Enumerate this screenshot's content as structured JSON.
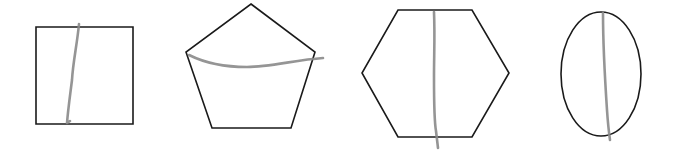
{
  "figure": {
    "colors": {
      "outline": "#1a1a1a",
      "cut_line": "#8a8a8a",
      "background": "#ffffff"
    },
    "shapes": [
      {
        "id": "square",
        "label": "square",
        "points": "36,27 133,27 133,124 36,124",
        "cut_line": {
          "orientation": "vertical",
          "path": "M79,24 C77,45 73,62 72,80 C70,96 68,110 67,123 L70,121"
        }
      },
      {
        "id": "pentagon",
        "label": "pentagon",
        "points": "251,4 315,52 291,128 212,128 186,52",
        "cut_line": {
          "orientation": "horizontal",
          "path": "M189,55 C205,63 225,67 247,67 C270,67 295,60 323,58"
        }
      },
      {
        "id": "hexagon",
        "label": "hexagon",
        "points": "398,10 472,10 509,73 472,137 398,137 362,73",
        "cut_line": {
          "orientation": "vertical",
          "path": "M434,12 C435,35 434,55 434,77 C434,100 434,120 436,131 L438,148"
        }
      },
      {
        "id": "ellipse",
        "label": "ellipse",
        "ellipse": {
          "cx": 601,
          "cy": 74,
          "rx": 40,
          "ry": 62
        },
        "cut_line": {
          "orientation": "vertical",
          "path": "M603,13 C603,45 605,80 607,110 C608,125 609,133 610,140"
        }
      }
    ]
  }
}
